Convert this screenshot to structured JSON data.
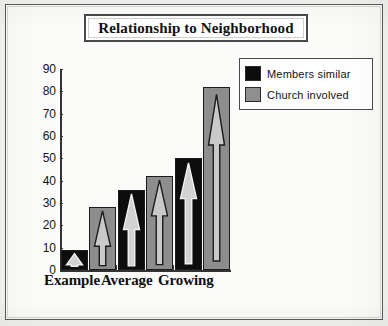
{
  "chart_data": {
    "type": "bar",
    "title": "Relationship to Neighborhood",
    "categories": [
      "Example",
      "Average",
      "Growing"
    ],
    "series": [
      {
        "name": "Members similar",
        "color": "#0d0d0d",
        "values": [
          9,
          36,
          50
        ]
      },
      {
        "name": "Church involved",
        "color": "#8d8d8d",
        "values": [
          28,
          42,
          82
        ]
      }
    ],
    "xlabel": "",
    "ylabel": "",
    "ylim": [
      0,
      90
    ],
    "yticks": [
      0,
      10,
      20,
      30,
      40,
      50,
      60,
      70,
      80,
      90
    ],
    "ytick_labels": [
      "0",
      "10",
      "20",
      "30",
      "40",
      "50",
      "60",
      "70",
      "80",
      "90"
    ],
    "grid": false,
    "legend_position": "top-right",
    "bar_decoration": "upward-arrow"
  },
  "legend": {
    "items": [
      {
        "label": "Members similar",
        "swatch": "black-swatch-icon"
      },
      {
        "label": "Church involved",
        "swatch": "gray-swatch-icon"
      }
    ]
  },
  "colors": {
    "members_similar": "#0d0d0d",
    "church_involved": "#8d8d8d",
    "axis": "#333333",
    "frame": "#5a5a5a",
    "page": "#fbfbfa"
  }
}
